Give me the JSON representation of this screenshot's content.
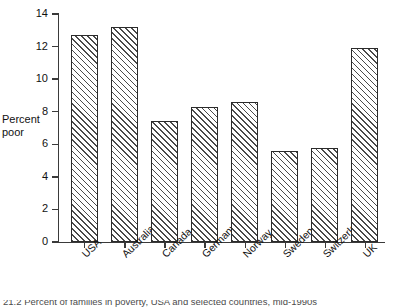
{
  "chart_data": {
    "type": "bar",
    "title": "",
    "xlabel": "",
    "ylabel": "Percent\npoor",
    "ylim": [
      0,
      14
    ],
    "ytick_values": [
      0,
      2,
      4,
      6,
      8,
      10,
      12,
      14
    ],
    "ytick_labels": [
      "0",
      "2",
      "4",
      "6",
      "8",
      "10",
      "12",
      "14"
    ],
    "grid": false,
    "legend": false,
    "categories": [
      "USA",
      "Australia",
      "Canada",
      "Germany",
      "Norway",
      "Sweden",
      "Switzerland",
      "UK"
    ],
    "values": [
      12.7,
      13.2,
      7.4,
      8.3,
      8.6,
      5.6,
      5.8,
      11.9
    ],
    "bar_style": {
      "fill": "#ffffff",
      "hatch": "diagonal-45",
      "hatch_color": "#4a4a4a",
      "edge_color": "#2b2b2b"
    }
  },
  "caption": {
    "text": "21.2  Percent of families in poverty, USA and selected countries, mid-1990s"
  }
}
